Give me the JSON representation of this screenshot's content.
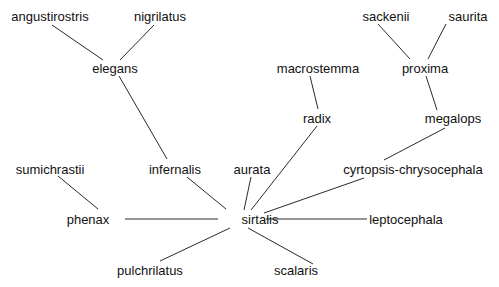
{
  "diagram": {
    "type": "unrooted-tree",
    "colors": {
      "edge": "#2a2a2a",
      "text": "#111111",
      "background": "#ffffff"
    },
    "nodes": [
      {
        "id": "angustirostris",
        "label": "angustirostris",
        "x": 50,
        "y": 16
      },
      {
        "id": "nigrilatus",
        "label": "nigrilatus",
        "x": 160,
        "y": 16
      },
      {
        "id": "elegans",
        "label": "elegans",
        "x": 115,
        "y": 68
      },
      {
        "id": "infernalis",
        "label": "infernalis",
        "x": 175,
        "y": 169
      },
      {
        "id": "sumichrastii",
        "label": "sumichrastii",
        "x": 50,
        "y": 169
      },
      {
        "id": "phenax",
        "label": "phenax",
        "x": 88,
        "y": 219
      },
      {
        "id": "sirtalis",
        "label": "sirtalis",
        "x": 260,
        "y": 219
      },
      {
        "id": "aurata",
        "label": "aurata",
        "x": 252,
        "y": 169
      },
      {
        "id": "pulchrilatus",
        "label": "pulchrilatus",
        "x": 150,
        "y": 270
      },
      {
        "id": "scalaris",
        "label": "scalaris",
        "x": 296,
        "y": 270
      },
      {
        "id": "leptocephala",
        "label": "leptocephala",
        "x": 406,
        "y": 219
      },
      {
        "id": "cyrtopsis-chrysocephala",
        "label": "cyrtopsis-chrysocephala",
        "x": 413,
        "y": 169
      },
      {
        "id": "megalops",
        "label": "megalops",
        "x": 453,
        "y": 118
      },
      {
        "id": "radix",
        "label": "radix",
        "x": 317,
        "y": 118
      },
      {
        "id": "macrostemma",
        "label": "macrostemma",
        "x": 318,
        "y": 68
      },
      {
        "id": "proxima",
        "label": "proxima",
        "x": 425,
        "y": 68
      },
      {
        "id": "sackenii",
        "label": "sackenii",
        "x": 386,
        "y": 16
      },
      {
        "id": "saurita",
        "label": "saurita",
        "x": 468,
        "y": 16
      }
    ],
    "edges": [
      {
        "from": "angustirostris",
        "to": "elegans",
        "x1": 52,
        "y1": 25,
        "x2": 103,
        "y2": 60
      },
      {
        "from": "nigrilatus",
        "to": "elegans",
        "x1": 154,
        "y1": 25,
        "x2": 120,
        "y2": 60
      },
      {
        "from": "elegans",
        "to": "infernalis",
        "x1": 119,
        "y1": 76,
        "x2": 167,
        "y2": 159
      },
      {
        "from": "infernalis",
        "to": "sirtalis",
        "x1": 187,
        "y1": 177,
        "x2": 226,
        "y2": 209
      },
      {
        "from": "sumichrastii",
        "to": "phenax",
        "x1": 58,
        "y1": 176,
        "x2": 98,
        "y2": 209
      },
      {
        "from": "phenax",
        "to": "sirtalis",
        "x1": 125,
        "y1": 219,
        "x2": 218,
        "y2": 219
      },
      {
        "from": "aurata",
        "to": "sirtalis",
        "x1": 251,
        "y1": 177,
        "x2": 244,
        "y2": 210
      },
      {
        "from": "radix",
        "to": "sirtalis",
        "x1": 317,
        "y1": 126,
        "x2": 251,
        "y2": 210
      },
      {
        "from": "cyrtopsis-chrysocephala",
        "to": "sirtalis",
        "x1": 364,
        "y1": 178,
        "x2": 264,
        "y2": 213
      },
      {
        "from": "sirtalis",
        "to": "leptocephala",
        "x1": 266,
        "y1": 219,
        "x2": 367,
        "y2": 219
      },
      {
        "from": "sirtalis",
        "to": "pulchrilatus",
        "x1": 230,
        "y1": 228,
        "x2": 160,
        "y2": 261
      },
      {
        "from": "sirtalis",
        "to": "scalaris",
        "x1": 248,
        "y1": 228,
        "x2": 313,
        "y2": 264
      },
      {
        "from": "megalops",
        "to": "cyrtopsis-chrysocephala",
        "x1": 445,
        "y1": 128,
        "x2": 384,
        "y2": 160
      },
      {
        "from": "macrostemma",
        "to": "radix",
        "x1": 310,
        "y1": 76,
        "x2": 318,
        "y2": 109
      },
      {
        "from": "proxima",
        "to": "megalops",
        "x1": 426,
        "y1": 76,
        "x2": 437,
        "y2": 110
      },
      {
        "from": "sackenii",
        "to": "proxima",
        "x1": 378,
        "y1": 24,
        "x2": 410,
        "y2": 59
      },
      {
        "from": "saurita",
        "to": "proxima",
        "x1": 446,
        "y1": 24,
        "x2": 428,
        "y2": 59
      }
    ]
  }
}
